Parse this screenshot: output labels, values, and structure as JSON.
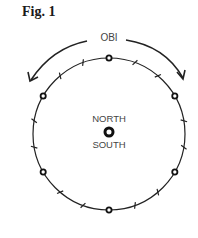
{
  "figure": {
    "title": "Fig. 1",
    "arc_label": "OBI",
    "center_top_label": "NORTH",
    "center_bottom_label": "SOUTH",
    "circle_markers": 6,
    "tick_divisions": 18,
    "line_color": "#222222",
    "text_color": "#444444"
  }
}
